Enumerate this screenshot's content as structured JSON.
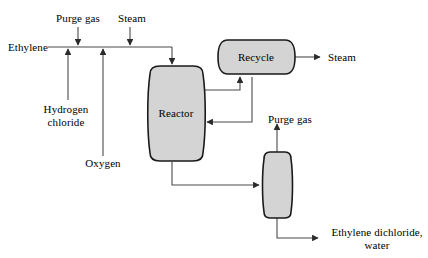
{
  "diagram": {
    "colors": {
      "line": "#3a3a3a",
      "vessel_fill": "#d4d4d4",
      "vessel_stroke": "#1a1a1a",
      "text": "#000000",
      "background": "#ffffff"
    },
    "vessels": [
      {
        "id": "reactor",
        "label": "Reactor",
        "shape": "barrel"
      },
      {
        "id": "recycle",
        "label": "Recycle",
        "shape": "horizontal-drum"
      },
      {
        "id": "separator",
        "label": "",
        "shape": "barrel"
      }
    ],
    "stream_labels": {
      "ethylene": "Ethylene",
      "purge_gas_top": "Purge gas",
      "steam_top": "Steam",
      "hydrogen_chloride": "Hydrogen\nchloride",
      "hydrogen_chloride_line1": "Hydrogen",
      "hydrogen_chloride_line2": "chloride",
      "oxygen": "Oxygen",
      "steam_out": "Steam",
      "purge_gas_mid": "Purge gas",
      "product_line1": "Ethylene dichloride,",
      "product_line2": "water"
    }
  }
}
